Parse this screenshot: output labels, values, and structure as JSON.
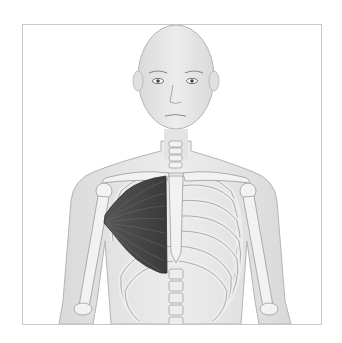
{
  "figure": {
    "highlighted_structure": "pectoral muscle",
    "colors": {
      "background": "#ffffff",
      "frame_border": "#c8c8c8",
      "skin": "#e6e6e6",
      "skin_outline": "#b4b4b4",
      "bone": "#f2f2f2",
      "bone_outline": "#9a9a9a",
      "muscle": "#4a4a4a",
      "muscle_dark": "#2e2e2e"
    }
  }
}
